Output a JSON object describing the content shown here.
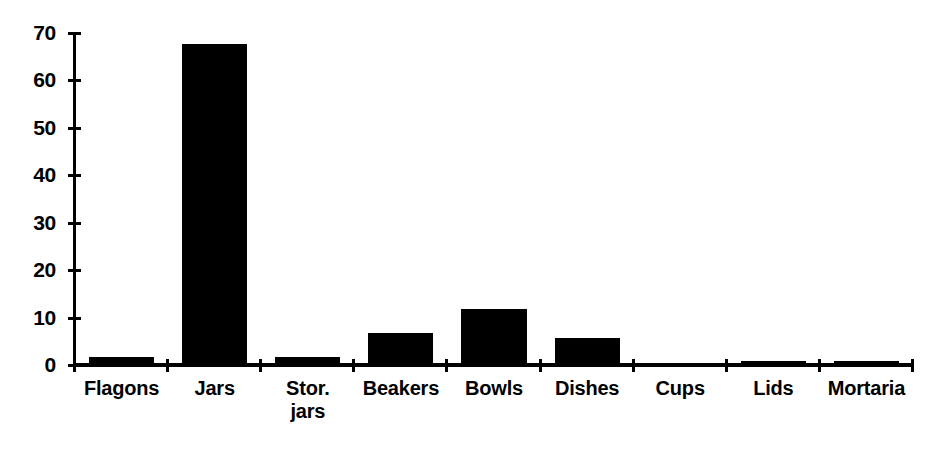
{
  "chart_data": {
    "type": "bar",
    "title": "",
    "subtitle": "",
    "xlabel": "",
    "ylabel": "",
    "categories": [
      "Flagons",
      "Jars",
      "Stor. jars",
      "Beakers",
      "Bowls",
      "Dishes",
      "Cups",
      "Lids",
      "Mortaria"
    ],
    "values": [
      2,
      68,
      2,
      7,
      12,
      6,
      0.3,
      1,
      1
    ],
    "ylim": [
      0,
      70
    ],
    "yticks": [
      0,
      10,
      20,
      30,
      40,
      50,
      60,
      70
    ],
    "ytick_labels": [
      "0",
      "10",
      "20",
      "30",
      "40",
      "50",
      "60",
      "70"
    ],
    "grid": false,
    "legend": false,
    "legend_position": "none",
    "bar_color": "#000000",
    "axis_color": "#000000",
    "background_color": "#ffffff"
  },
  "axis": {
    "y_ticks": [
      {
        "label": "70",
        "value": 70
      },
      {
        "label": "60",
        "value": 60
      },
      {
        "label": "50",
        "value": 50
      },
      {
        "label": "40",
        "value": 40
      },
      {
        "label": "30",
        "value": 30
      },
      {
        "label": "20",
        "value": 20
      },
      {
        "label": "10",
        "value": 10
      },
      {
        "label": "0",
        "value": 0
      }
    ]
  },
  "categories": [
    {
      "line1": "Flagons",
      "line2": "",
      "value": 2
    },
    {
      "line1": "Jars",
      "line2": "",
      "value": 68
    },
    {
      "line1": "Stor.",
      "line2": "jars",
      "value": 2
    },
    {
      "line1": "Beakers",
      "line2": "",
      "value": 7
    },
    {
      "line1": "Bowls",
      "line2": "",
      "value": 12
    },
    {
      "line1": "Dishes",
      "line2": "",
      "value": 6
    },
    {
      "line1": "Cups",
      "line2": "",
      "value": 0.3
    },
    {
      "line1": "Lids",
      "line2": "",
      "value": 1
    },
    {
      "line1": "Mortaria",
      "line2": "",
      "value": 1
    }
  ]
}
